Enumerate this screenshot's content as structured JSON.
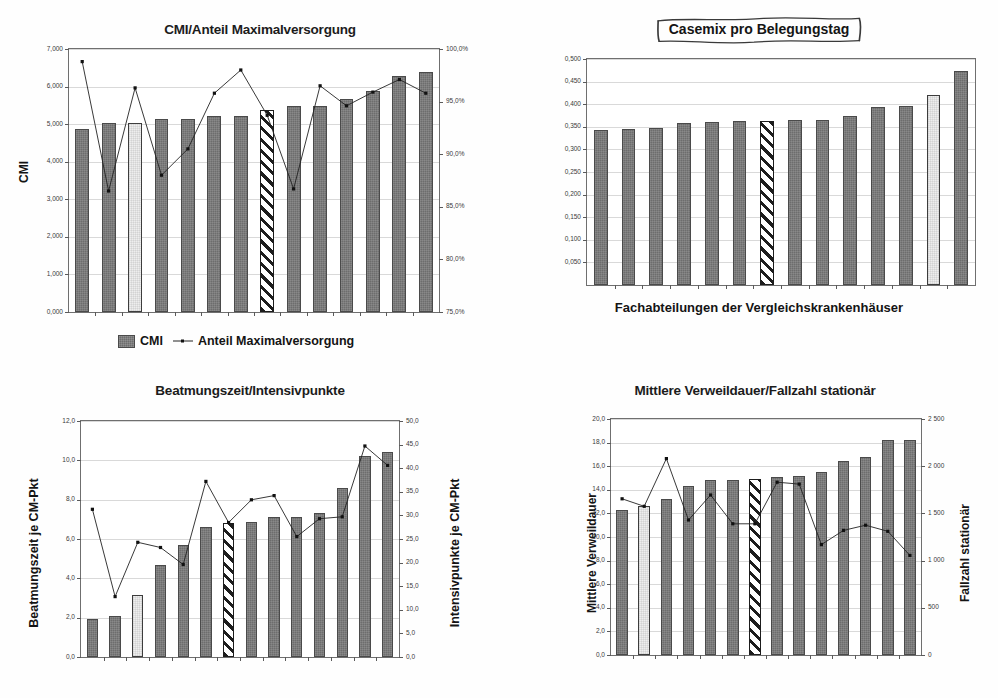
{
  "page": {
    "background": "#fefefe",
    "bar_color": "#6d6d6d",
    "highlight_color": "#eeeeee",
    "hatch_color": "#1d1d1d",
    "line_color": "#222222"
  },
  "charts": [
    {
      "id": "cmi-anteil-maximalversorgung",
      "title": "CMI/Anteil Maximalversorgung",
      "title_style": "plain",
      "ylabel_left": "CMI",
      "ylabel_right": "Anteil Maximalversorgung",
      "xlabel": "",
      "legend": [
        {
          "name": "CMI",
          "type": "bar"
        },
        {
          "name": "Anteil Maximalversorgung",
          "type": "line"
        }
      ],
      "chart_data": {
        "type": "bar",
        "title": "CMI/Anteil Maximalversorgung",
        "xlabel": "",
        "ylabel": "CMI",
        "ylabel2": "Anteil Maximalversorgung",
        "grid": true,
        "legend_position": "bottom",
        "categories": [
          "1",
          "2",
          "3",
          "4",
          "5",
          "6",
          "7",
          "8",
          "9",
          "10",
          "11",
          "12",
          "13"
        ],
        "ylim": [
          0.0,
          7.0
        ],
        "yticks": [
          0.0,
          1.0,
          2.0,
          3.0,
          4.0,
          5.0,
          6.0,
          7.0
        ],
        "ytick_labels": [
          "0,000",
          "1,000",
          "2,000",
          "3,000",
          "4,000",
          "5,000",
          "6,000",
          "7,000"
        ],
        "ylim2": [
          75.0,
          100.0
        ],
        "yticks2": [
          75.0,
          80.0,
          85.0,
          90.0,
          95.0,
          100.0
        ],
        "ytick_labels2": [
          "75,0%",
          "80,0%",
          "85,0%",
          "90,0%",
          "95,0%",
          "100,0%"
        ],
        "series": [
          {
            "name": "CMI",
            "type": "bar",
            "axis": "left",
            "values": [
              4.87,
              5.03,
              5.04,
              5.14,
              5.14,
              5.23,
              5.23,
              5.39,
              5.48,
              5.48,
              5.67,
              5.88,
              6.28,
              6.38
            ],
            "bar_styles": [
              "solid",
              "solid",
              "light",
              "solid",
              "solid",
              "solid",
              "solid",
              "hatched",
              "solid",
              "solid",
              "solid",
              "solid",
              "solid",
              "solid"
            ]
          },
          {
            "name": "Anteil Maximalversorgung",
            "type": "line",
            "axis": "right",
            "values": [
              98.8,
              86.5,
              96.3,
              88.0,
              90.5,
              95.8,
              98.0,
              93.7,
              86.7,
              96.5,
              94.6,
              95.9,
              97.1,
              95.8
            ]
          }
        ]
      }
    },
    {
      "id": "casemix-pro-belegungstag",
      "title": "Casemix pro Belegungstag",
      "title_style": "sketch-box",
      "ylabel_left": "",
      "ylabel_right": "",
      "xlabel": "Fachabteilungen der Vergleichskrankenhäuser",
      "legend": [],
      "chart_data": {
        "type": "bar",
        "title": "Casemix pro Belegungstag",
        "xlabel": "Fachabteilungen der Vergleichskrankenhäuser",
        "ylabel": "",
        "grid": true,
        "legend_position": "none",
        "categories": [
          "1",
          "2",
          "3",
          "4",
          "5",
          "6",
          "7",
          "8",
          "9",
          "10",
          "11",
          "12",
          "13"
        ],
        "ylim": [
          0.0,
          0.5
        ],
        "yticks": [
          0.05,
          0.1,
          0.15,
          0.2,
          0.25,
          0.3,
          0.35,
          0.4,
          0.45,
          0.5
        ],
        "ytick_labels": [
          "0,050",
          "0,100",
          "0,150",
          "0,200",
          "0,250",
          "0,300",
          "0,350",
          "0,400",
          "0,450",
          "0,500"
        ],
        "series": [
          {
            "name": "Casemix pro Belegungstag",
            "type": "bar",
            "values": [
              0.343,
              0.346,
              0.348,
              0.359,
              0.361,
              0.362,
              0.363,
              0.365,
              0.366,
              0.373,
              0.394,
              0.396,
              0.42,
              0.473
            ],
            "bar_styles": [
              "solid",
              "solid",
              "solid",
              "solid",
              "solid",
              "solid",
              "hatched",
              "solid",
              "solid",
              "solid",
              "solid",
              "solid",
              "light",
              "solid"
            ]
          }
        ]
      }
    },
    {
      "id": "beatmungszeit-intensivpunkte",
      "title": "Beatmungszeit/Intensivpunkte",
      "title_style": "plain",
      "ylabel_left": "Beatmungszeit je CM-Pkt",
      "ylabel_right": "Intensivpunkte je CM-Pkt",
      "xlabel": "",
      "legend": [],
      "chart_data": {
        "type": "bar",
        "title": "Beatmungszeit/Intensivpunkte",
        "xlabel": "",
        "ylabel": "Beatmungszeit je CM-Pkt",
        "ylabel2": "Intensivpunkte je CM-Pkt",
        "grid": true,
        "legend_position": "none",
        "categories": [
          "1",
          "2",
          "3",
          "4",
          "5",
          "6",
          "7",
          "8",
          "9",
          "10",
          "11",
          "12",
          "13"
        ],
        "ylim": [
          0.0,
          12.0
        ],
        "yticks": [
          0.0,
          2.0,
          4.0,
          6.0,
          8.0,
          10.0,
          12.0
        ],
        "ytick_labels": [
          "0,0",
          "2,0",
          "4,0",
          "6,0",
          "8,0",
          "10,0",
          "12,0"
        ],
        "ylim2": [
          0.0,
          50.0
        ],
        "yticks2": [
          0.0,
          5.0,
          10.0,
          15.0,
          20.0,
          25.0,
          30.0,
          35.0,
          40.0,
          45.0,
          50.0
        ],
        "ytick_labels2": [
          "0,0",
          "5,0",
          "10,0",
          "15,0",
          "20,0",
          "25,0",
          "30,0",
          "35,0",
          "40,0",
          "45,0",
          "50,0"
        ],
        "series": [
          {
            "name": "Beatmungszeit je CM-Pkt",
            "type": "bar",
            "axis": "left",
            "values": [
              1.92,
              2.08,
              3.14,
              4.66,
              5.68,
              6.62,
              6.8,
              6.86,
              7.1,
              7.14,
              7.32,
              8.6,
              10.24,
              10.4
            ],
            "bar_styles": [
              "solid",
              "solid",
              "light",
              "solid",
              "solid",
              "solid",
              "hatched",
              "solid",
              "solid",
              "solid",
              "solid",
              "solid",
              "solid",
              "solid"
            ]
          },
          {
            "name": "Intensivpunkte je CM-Pkt",
            "type": "line",
            "axis": "right",
            "values": [
              31.3,
              12.8,
              24.3,
              23.2,
              19.6,
              37.2,
              28.5,
              33.3,
              34.2,
              25.5,
              29.3,
              29.7,
              44.7,
              40.6
            ]
          }
        ]
      }
    },
    {
      "id": "mittlere-verweildauer-fallzahl",
      "title": "Mittlere Verweildauer/Fallzahl stationär",
      "title_style": "plain",
      "ylabel_left": "Mittlere Verweildauer",
      "ylabel_right": "Fallzahl stationär",
      "xlabel": "",
      "legend": [],
      "chart_data": {
        "type": "bar",
        "title": "Mittlere Verweildauer/Fallzahl stationär",
        "xlabel": "",
        "ylabel": "Mittlere Verweildauer",
        "ylabel2": "Fallzahl stationär",
        "grid": true,
        "legend_position": "none",
        "categories": [
          "1",
          "2",
          "3",
          "4",
          "5",
          "6",
          "7",
          "8",
          "9",
          "10",
          "11",
          "12",
          "13"
        ],
        "ylim": [
          0.0,
          20.0
        ],
        "yticks": [
          0.0,
          2.0,
          4.0,
          6.0,
          8.0,
          10.0,
          12.0,
          14.0,
          16.0,
          18.0,
          20.0
        ],
        "ytick_labels": [
          "0,0",
          "2,0",
          "4,0",
          "6,0",
          "8,0",
          "10,0",
          "12,0",
          "14,0",
          "16,0",
          "18,0",
          "20,0"
        ],
        "ylim2": [
          0,
          2500
        ],
        "yticks2": [
          0,
          500,
          1000,
          1500,
          2000,
          2500
        ],
        "ytick_labels2": [
          "0",
          "500",
          "1 000",
          "1 500",
          "2 000",
          "2 500"
        ],
        "series": [
          {
            "name": "Mittlere Verweildauer",
            "type": "bar",
            "axis": "left",
            "values": [
              12.3,
              12.6,
              13.2,
              14.3,
              14.8,
              14.8,
              14.9,
              15.1,
              15.2,
              15.5,
              16.4,
              16.8,
              18.2,
              18.2
            ],
            "bar_styles": [
              "solid",
              "light",
              "solid",
              "solid",
              "solid",
              "solid",
              "hatched",
              "solid",
              "solid",
              "solid",
              "solid",
              "solid",
              "solid",
              "solid"
            ]
          },
          {
            "name": "Fallzahl stationär",
            "type": "line",
            "axis": "right",
            "values": [
              1655,
              1575,
              2080,
              1430,
              1695,
              1390,
              1390,
              1830,
              1810,
              1170,
              1320,
              1375,
              1310,
              1055
            ]
          }
        ]
      }
    }
  ]
}
